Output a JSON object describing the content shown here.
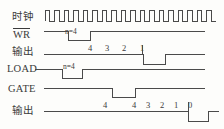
{
  "diagram": {
    "line_color": "#4a4a4a",
    "text_color": "#3a3a3a",
    "background": "#fdfdfb"
  },
  "rows": [
    {
      "id": "clock",
      "label": "时钟",
      "script": "cn",
      "overline": false
    },
    {
      "id": "wr",
      "label": "WR",
      "script": "en",
      "overline": true
    },
    {
      "id": "out1",
      "label": "输出",
      "script": "cn",
      "overline": false
    },
    {
      "id": "load",
      "label": "LOAD",
      "script": "en",
      "overline": false
    },
    {
      "id": "gate",
      "label": "GATE",
      "script": "en",
      "overline": false
    },
    {
      "id": "out2",
      "label": "输出",
      "script": "cn",
      "overline": false
    }
  ],
  "annotations": {
    "wr_n": "n=4",
    "load_n": "n=4"
  },
  "counts": {
    "out1": [
      "4",
      "3",
      "2",
      "1"
    ],
    "out2_initial": [
      "4"
    ],
    "out2_sequence": [
      "4",
      "3",
      "2",
      "1",
      "0"
    ]
  },
  "clock": {
    "pulse_count": 18,
    "description": "square wave"
  }
}
